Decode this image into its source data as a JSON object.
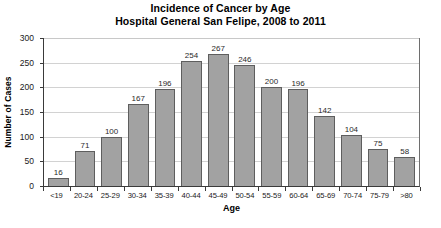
{
  "chart_data": {
    "type": "bar",
    "title": "Incidence of Cancer by Age",
    "subtitle": "Hospital General San Felipe, 2008 to 2011",
    "xlabel": "Age",
    "ylabel": "Number of Cases",
    "ylim": [
      0,
      300
    ],
    "yticks": [
      0,
      50,
      100,
      150,
      200,
      250,
      300
    ],
    "grid": true,
    "legend": "none",
    "bar_color": "#a2a2a2",
    "bar_border_color": "#5e5e5e",
    "axis_color": "#3a3a3a",
    "grid_color": "#d2d2d2",
    "categories": [
      "<19",
      "20-24",
      "25-29",
      "30-34",
      "35-39",
      "40-44",
      "45-49",
      "50-54",
      "55-59",
      "60-64",
      "65-69",
      "70-74",
      "75-79",
      ">80"
    ],
    "values": [
      16,
      71,
      100,
      167,
      196,
      254,
      267,
      246,
      200,
      196,
      142,
      104,
      75,
      58
    ],
    "data_labels": [
      "16",
      "71",
      "100",
      "167",
      "196",
      "254",
      "267",
      "246",
      "200",
      "196",
      "142",
      "104",
      "75",
      "58"
    ]
  }
}
